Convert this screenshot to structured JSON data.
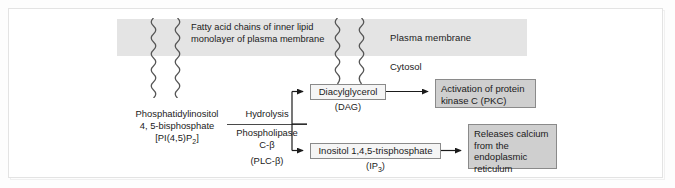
{
  "diagram": {
    "membrane": {
      "plasma_membrane_label": "Plasma membrane",
      "fatty_acid_label_line1": "Fatty acid chains of inner lipid",
      "fatty_acid_label_line2": "monolayer of plasma membrane",
      "cytosol_label": "Cytosol",
      "band_color": "#e4e4e4"
    },
    "substrate": {
      "line1": "Phosphatidylinositol",
      "line2": "4, 5-bisphosphate",
      "line3": "[PI(4,5)P",
      "line3_sub": "2",
      "line3_end": "]"
    },
    "enzyme": {
      "reaction": "Hydrolysis",
      "name_line1": "Phospholipase",
      "name_line2": "C-β",
      "abbrev": "(PLC-β)"
    },
    "products": [
      {
        "id": "dag",
        "label": "Diacylglycerol",
        "abbrev": "(DAG)",
        "style": "plain"
      },
      {
        "id": "ip3",
        "label": "Inositol 1,4,5-trisphosphate",
        "abbrev_pre": "(IP",
        "abbrev_sub": "3",
        "abbrev_post": ")",
        "style": "plain"
      }
    ],
    "outcomes": [
      {
        "id": "pkc",
        "line1": "Activation of  protein",
        "line2": "kinase C (PKC)",
        "style": "shaded",
        "fill": "#cfcfcf"
      },
      {
        "id": "calcium",
        "line1": "Releases calcium",
        "line2": "from the",
        "line3": "endoplasmic",
        "line4": "reticulum",
        "style": "shaded",
        "fill": "#cfcfcf"
      }
    ]
  }
}
